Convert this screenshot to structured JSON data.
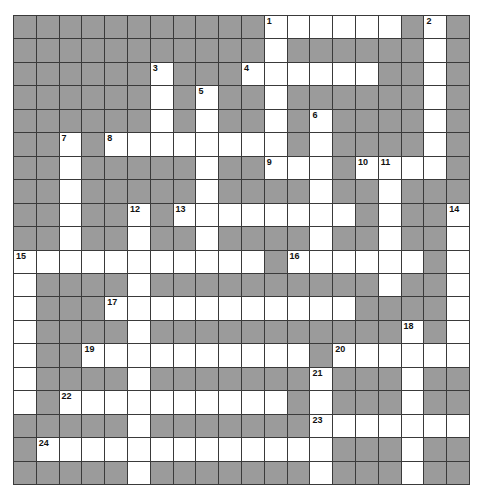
{
  "puzzle": {
    "rows": 20,
    "cols": 20,
    "colors": {
      "block": "#9b9b9b",
      "open": "#ffffff",
      "gridline": "#3a3a3a"
    },
    "layout": [
      "...........######.#.",
      "...........#......#.",
      "......#...######..#.",
      "......#.#..#......#.",
      "......#.#..#.#....#.",
      "..#.########.#....#.",
      "..#.....#..###.####.",
      "..#.....#....#..#...",
      "..#..#.########.#..#",
      "..#..#..#....#..#..#",
      "###########.######.#",
      "#....#..........#..#",
      "#...###########....#",
      "#....#...........#.#",
      "#..##########.######",
      "#....#.......#...#..",
      "#.##########.#...#..",
      ".....#.......#######",
      ".#############...#..",
      ".....#.......#...#.."
    ],
    "numbers": [
      {
        "n": "1",
        "r": 0,
        "c": 11
      },
      {
        "n": "2",
        "r": 0,
        "c": 18
      },
      {
        "n": "3",
        "r": 2,
        "c": 6
      },
      {
        "n": "4",
        "r": 2,
        "c": 10
      },
      {
        "n": "5",
        "r": 3,
        "c": 8
      },
      {
        "n": "6",
        "r": 4,
        "c": 13
      },
      {
        "n": "7",
        "r": 5,
        "c": 2
      },
      {
        "n": "8",
        "r": 5,
        "c": 4
      },
      {
        "n": "9",
        "r": 6,
        "c": 11
      },
      {
        "n": "10",
        "r": 6,
        "c": 15
      },
      {
        "n": "11",
        "r": 6,
        "c": 16
      },
      {
        "n": "12",
        "r": 8,
        "c": 5
      },
      {
        "n": "13",
        "r": 8,
        "c": 7
      },
      {
        "n": "14",
        "r": 8,
        "c": 19
      },
      {
        "n": "15",
        "r": 10,
        "c": 0
      },
      {
        "n": "16",
        "r": 10,
        "c": 12
      },
      {
        "n": "17",
        "r": 12,
        "c": 4
      },
      {
        "n": "18",
        "r": 13,
        "c": 17
      },
      {
        "n": "19",
        "r": 14,
        "c": 3
      },
      {
        "n": "20",
        "r": 14,
        "c": 14
      },
      {
        "n": "21",
        "r": 15,
        "c": 13
      },
      {
        "n": "22",
        "r": 16,
        "c": 2
      },
      {
        "n": "23",
        "r": 17,
        "c": 13
      },
      {
        "n": "24",
        "r": 18,
        "c": 1
      }
    ]
  }
}
